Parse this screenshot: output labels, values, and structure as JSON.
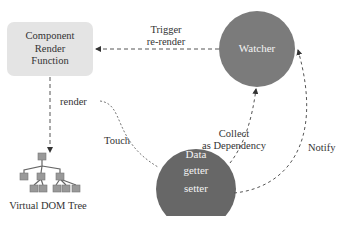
{
  "diagram": {
    "component": {
      "line1": "Component",
      "line2": "Render",
      "line3": "Function"
    },
    "watcher": {
      "label": "Watcher",
      "color": "#7b7b7b"
    },
    "data_node": {
      "line1": "Data",
      "line2": "getter",
      "line3": "setter",
      "color": "#676767"
    },
    "vdom": {
      "label": "Virtual DOM Tree"
    },
    "edges": {
      "trigger": {
        "line1": "Trigger",
        "line2": "re-render"
      },
      "render": "render",
      "touch": "Touch",
      "collect": {
        "line1": "Collect",
        "line2": "as Dependency"
      },
      "notify": "Notify"
    }
  }
}
